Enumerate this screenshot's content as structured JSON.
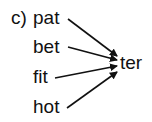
{
  "diagram": {
    "label": "c)",
    "sources": [
      "pat",
      "bet",
      "fit",
      "hot"
    ],
    "target": "ter",
    "edges": [
      {
        "from": "pat",
        "to": "ter"
      },
      {
        "from": "bet",
        "to": "ter"
      },
      {
        "from": "fit",
        "to": "ter"
      },
      {
        "from": "hot",
        "to": "ter"
      }
    ],
    "arrow_color": "#111111"
  }
}
